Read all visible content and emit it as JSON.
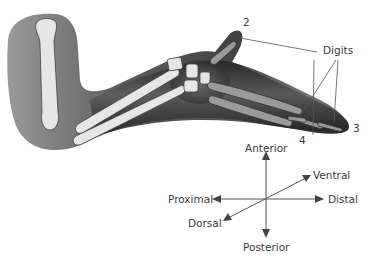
{
  "figure": {
    "digit_labels": {
      "group_label": "Digits",
      "digit_2": "2",
      "digit_3": "3",
      "digit_4": "4"
    },
    "axes": {
      "anterior": "Anterior",
      "posterior": "Posterior",
      "proximal": "Proximal",
      "distal": "Distal",
      "dorsal": "Dorsal",
      "ventral": "Ventral"
    },
    "colors": {
      "background": "#ffffff",
      "tissue_dark": "#1e1e1e",
      "tissue_mid": "#6a6a6a",
      "bone": "#e8e8e8",
      "bone_outline": "#444444",
      "label_text": "#3a3a3a",
      "leader_line": "#555555"
    }
  }
}
